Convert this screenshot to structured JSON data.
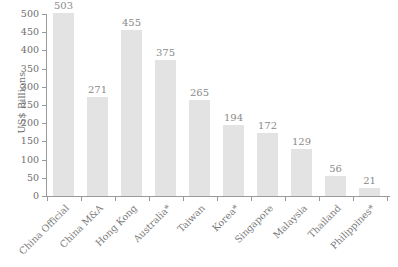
{
  "chart_data": {
    "type": "bar",
    "title": "",
    "subtitle": "",
    "xlabel": "",
    "ylabel": "US$ Billions",
    "ylim": [
      0,
      500
    ],
    "yticks": [
      0,
      50,
      100,
      150,
      200,
      250,
      300,
      350,
      400,
      450,
      500
    ],
    "grid": false,
    "legend": false,
    "bar_color": "#e3e3e3",
    "categories": [
      "China Official",
      "China M&A",
      "Hong Kong",
      "Australia*",
      "Taiwan",
      "Korea*",
      "Singapore",
      "Malaysia",
      "Thailand",
      "Philippines*"
    ],
    "values": [
      503,
      271,
      455,
      375,
      265,
      194,
      172,
      129,
      56,
      21
    ],
    "value_labels": [
      "503",
      "271",
      "455",
      "375",
      "265",
      "194",
      "172",
      "129",
      "56",
      "21"
    ]
  },
  "axis": {
    "y_title": "US$ Billions",
    "y_tick_labels": [
      "500",
      "450",
      "400",
      "350",
      "300",
      "250",
      "200",
      "150",
      "100",
      "50",
      "0"
    ]
  }
}
